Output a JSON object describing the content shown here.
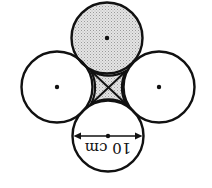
{
  "diagram": {
    "orientation": "rotated 180 degrees",
    "colors": {
      "stroke": "#111111",
      "shade": "#d0d0d0",
      "background": "#ffffff"
    },
    "circles": [
      {
        "name": "top",
        "cx": 107,
        "cy": 38,
        "r": 35.5,
        "shaded": true
      },
      {
        "name": "left",
        "cx": 57,
        "cy": 87,
        "r": 35.5,
        "shaded": false
      },
      {
        "name": "right",
        "cx": 159,
        "cy": 87,
        "r": 35.5,
        "shaded": false
      },
      {
        "name": "bottom",
        "cx": 108,
        "cy": 136,
        "r": 35.5,
        "shaded": false
      }
    ],
    "dimension": {
      "label": "10 cm",
      "meaning": "diameter of each circle"
    }
  }
}
